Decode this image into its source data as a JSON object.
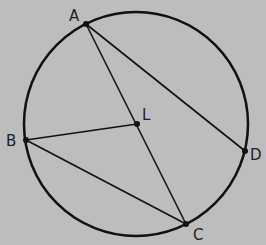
{
  "diagram": {
    "title": "",
    "background": "#bdbdbd",
    "stroke_color": "#111111",
    "circle": {
      "cx": 136,
      "cy": 124,
      "r": 112
    },
    "points": {
      "A": {
        "label": "A",
        "x": 86,
        "y": 24,
        "lx": 69,
        "ly": 21
      },
      "B": {
        "label": "B",
        "x": 26,
        "y": 140,
        "lx": 6,
        "ly": 146
      },
      "C": {
        "label": "C",
        "x": 186,
        "y": 224,
        "lx": 193,
        "ly": 240
      },
      "D": {
        "label": "D",
        "x": 245,
        "y": 151,
        "lx": 250,
        "ly": 160
      },
      "L": {
        "label": "L",
        "x": 137,
        "y": 124,
        "lx": 142,
        "ly": 120
      }
    },
    "segments": [
      [
        "A",
        "D"
      ],
      [
        "A",
        "C"
      ],
      [
        "B",
        "L"
      ],
      [
        "B",
        "C"
      ]
    ]
  }
}
